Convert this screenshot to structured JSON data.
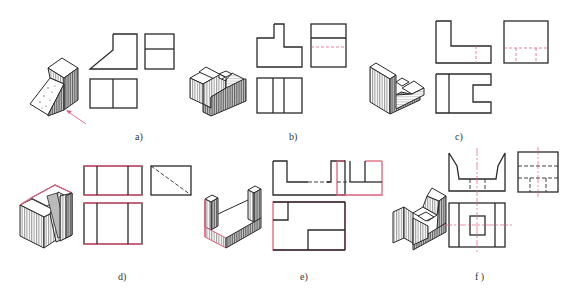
{
  "figure": {
    "colors": {
      "line": "#2a2a2a",
      "highlight": "#e0607e",
      "background": "#ffffff"
    },
    "panels": [
      {
        "id": "a",
        "label": "a)",
        "views": [
          "isometric",
          "front",
          "side",
          "top"
        ],
        "annotation": "arrow-indicating-view-direction"
      },
      {
        "id": "b",
        "label": "b)",
        "views": [
          "isometric",
          "front",
          "side",
          "top"
        ]
      },
      {
        "id": "c",
        "label": "c)",
        "views": [
          "isometric",
          "front",
          "side",
          "top"
        ]
      },
      {
        "id": "d",
        "label": "d)",
        "views": [
          "isometric",
          "front",
          "side",
          "top"
        ]
      },
      {
        "id": "e",
        "label": "e)",
        "views": [
          "isometric",
          "front",
          "side",
          "top"
        ]
      },
      {
        "id": "f",
        "label": "f )",
        "views": [
          "isometric",
          "front",
          "side",
          "top"
        ]
      }
    ]
  }
}
